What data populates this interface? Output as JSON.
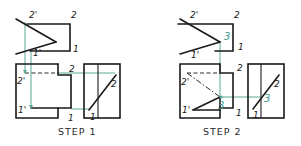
{
  "figure": {
    "colors": {
      "object_line": "#1a1a1a",
      "projection_line": "#5aa898",
      "label_green": "#3a9a88"
    },
    "steps": [
      {
        "caption": "STEP 1",
        "labels": {
          "top_2p": "2'",
          "top_2": "2",
          "top_1": "1",
          "top_1p": "1'",
          "front_2": "2",
          "front_2p": "2'",
          "front_1p": "1'",
          "front_1": "1",
          "side_2": "2",
          "side_1": "1"
        }
      },
      {
        "caption": "STEP 2",
        "labels": {
          "top_2p": "2'",
          "top_2": "2",
          "top_3": "3",
          "top_1": "1",
          "top_1p": "1'",
          "front_2": "2",
          "front_2p": "2'",
          "front_1p": "1'",
          "front_3": "3",
          "front_1": "1",
          "side_2": "2",
          "side_3": "3",
          "side_1": "1"
        }
      }
    ]
  }
}
